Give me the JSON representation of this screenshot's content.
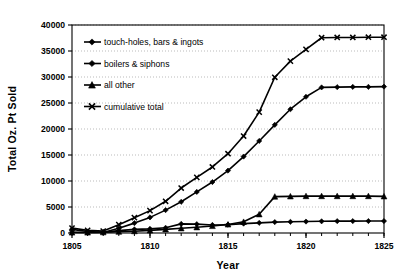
{
  "chart_data": {
    "type": "line",
    "title": "",
    "xlabel": "Year",
    "ylabel": "Total Oz. Pt Sold",
    "xlim": [
      1805,
      1825
    ],
    "ylim": [
      0,
      40000
    ],
    "xticks": [
      1805,
      1810,
      1815,
      1820,
      1825
    ],
    "xtick_labels": [
      "1805",
      "1810",
      "1815",
      "1820",
      "1825"
    ],
    "yticks": [
      0,
      5000,
      10000,
      15000,
      20000,
      25000,
      30000,
      35000,
      40000
    ],
    "ytick_labels": [
      "0",
      "5000",
      "10000",
      "15000",
      "20000",
      "25000",
      "30000",
      "35000",
      "40000"
    ],
    "grid": "horizontal-dotted",
    "legend_position": "upper-left-inside",
    "x": [
      1805,
      1806,
      1807,
      1808,
      1809,
      1810,
      1811,
      1812,
      1813,
      1814,
      1815,
      1816,
      1817,
      1818,
      1819,
      1820,
      1821,
      1822,
      1823,
      1824,
      1825
    ],
    "series": [
      {
        "name": "touch-holes, bars & ingots",
        "marker": "diamond",
        "values": [
          700,
          300,
          120,
          450,
          700,
          800,
          1000,
          1750,
          1700,
          1550,
          1600,
          1800,
          1950,
          2100,
          2150,
          2200,
          2250,
          2280,
          2290,
          2300,
          2300
        ]
      },
      {
        "name": "boilers & siphons",
        "marker": "diamond",
        "values": [
          150,
          100,
          100,
          900,
          1900,
          3000,
          4400,
          6000,
          7900,
          9800,
          12000,
          14700,
          17700,
          20800,
          23800,
          26200,
          28000,
          28050,
          28100,
          28100,
          28150
        ]
      },
      {
        "name": "all other",
        "marker": "triangle",
        "values": [
          100,
          100,
          150,
          250,
          350,
          500,
          700,
          900,
          1100,
          1350,
          1650,
          2150,
          3600,
          7000,
          7050,
          7100,
          7100,
          7100,
          7100,
          7100,
          7050
        ]
      },
      {
        "name": "cumulative total",
        "marker": "x",
        "values": [
          950,
          500,
          370,
          1600,
          2950,
          4300,
          6100,
          8650,
          10700,
          12700,
          15250,
          18650,
          23250,
          29950,
          33050,
          35300,
          37550,
          37600,
          37600,
          37650,
          37650
        ]
      }
    ]
  },
  "legend": {
    "entries": [
      {
        "label": "touch-holes, bars & ingots",
        "marker": "diamond"
      },
      {
        "label": "boilers & siphons",
        "marker": "diamond"
      },
      {
        "label": "all other",
        "marker": "triangle"
      },
      {
        "label": "cumulative total",
        "marker": "x"
      }
    ]
  },
  "colors": {
    "line": "#000000",
    "axis": "#000000",
    "grid": "#aaaaaa",
    "background": "#ffffff"
  }
}
